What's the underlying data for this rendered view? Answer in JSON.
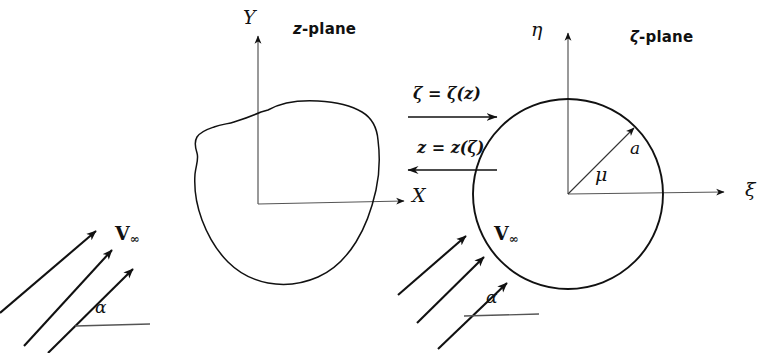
{
  "figure": {
    "z_plane": {
      "plane_label": "z-plane",
      "plane_label_italic": "z",
      "plane_label_rest": "-plane",
      "axis_y": "Y",
      "axis_x": "X",
      "body_shape": "irregular-closed-contour"
    },
    "zeta_plane": {
      "plane_label": "ζ-plane",
      "plane_label_italic": "ζ",
      "plane_label_rest": "-plane",
      "axis_y": "η",
      "axis_x": "ξ",
      "radius_label": "a",
      "angle_label": "μ",
      "body_shape": "circle"
    },
    "mapping": {
      "forward_label": "ζ = ζ(z)",
      "forward_direction": "right",
      "inverse_label": "z = z(ζ)",
      "inverse_direction": "left"
    },
    "flow_left": {
      "velocity_label_symbol": "V",
      "velocity_label_subscript": "∞",
      "angle_label": "α",
      "arrow_count": 3
    },
    "flow_right": {
      "velocity_label_symbol": "V",
      "velocity_label_subscript": "∞",
      "angle_label": "α",
      "arrow_count": 3
    },
    "colors": {
      "ink": "#111111",
      "background": "#ffffff"
    }
  }
}
